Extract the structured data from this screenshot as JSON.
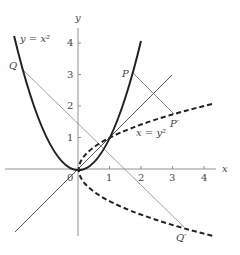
{
  "figure": {
    "origin_px": [
      78,
      169
    ],
    "scale_px_per_unit": 31.5,
    "axes": {
      "x_label": "x",
      "y_label": "y",
      "origin_label": "0",
      "x_ticks": [
        "1",
        "2",
        "3",
        "4"
      ],
      "y_ticks": [
        "1",
        "2",
        "3",
        "4"
      ]
    },
    "curves": {
      "parabola_label": "y = x²",
      "reflected_label": "x = y²",
      "mirror_line": "y = x"
    },
    "points": {
      "P": {
        "label": "P",
        "coords": [
          1.75,
          3.06
        ]
      },
      "P_prime": {
        "label": "P′",
        "coords": [
          3.06,
          1.75
        ]
      },
      "Q": {
        "label": "Q",
        "coords": [
          -1.78,
          3.17
        ]
      },
      "Q_prime": {
        "label": "Q′",
        "coords": [
          3.17,
          -1.78
        ]
      }
    },
    "colors": {
      "curve": "#222222",
      "axis": "#666666",
      "thin": "#555555",
      "text": "#444444"
    }
  }
}
